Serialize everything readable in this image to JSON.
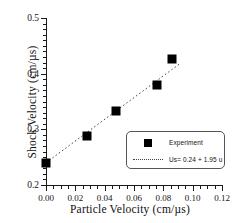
{
  "chart_data": {
    "type": "scatter",
    "title": "",
    "xlabel": "Particle Velocity (cm/µs)",
    "ylabel": "Shock Velocity (cm/µs)",
    "xlim": [
      0.0,
      0.12
    ],
    "ylim": [
      0.2,
      0.5
    ],
    "xticks": [
      "0.00",
      "0.02",
      "0.04",
      "0.06",
      "0.08",
      "0.10",
      "0.12"
    ],
    "xtick_values": [
      0.0,
      0.02,
      0.04,
      0.06,
      0.08,
      0.1,
      0.12
    ],
    "yticks": [
      "0.2",
      "0.3",
      "0.4",
      "0.5"
    ],
    "ytick_values": [
      0.2,
      0.3,
      0.4,
      0.5
    ],
    "grid": false,
    "legend_position": "lower right",
    "series": [
      {
        "name": "Experiment",
        "type": "scatter",
        "marker": "square",
        "color": "#000000",
        "x": [
          0.0,
          0.028,
          0.048,
          0.076,
          0.086
        ],
        "y": [
          0.24,
          0.288,
          0.333,
          0.38,
          0.427
        ]
      },
      {
        "name": "Us = 0.24 + 1.95 u",
        "type": "line",
        "style": "dotted",
        "color": "#404040",
        "intercept": 0.24,
        "slope": 1.95,
        "x": [
          0.0,
          0.092
        ],
        "y": [
          0.24,
          0.4194
        ]
      }
    ]
  },
  "axes": {
    "ylabel": "Shock Velocity (cm/µs)",
    "xlabel": "Particle Velocity (cm/µs)"
  },
  "legend": {
    "experiment_label": "Experiment",
    "fit_label": "Us= 0.24 + 1.95 u"
  }
}
